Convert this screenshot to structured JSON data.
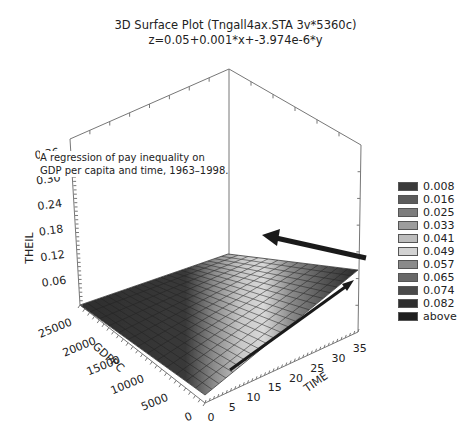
{
  "chart_data": {
    "type": "surface3d",
    "title": "3D Surface Plot (Tngall4ax.STA 3v*5360c)",
    "subtitle": "z=0.05+0.001*x+-3.974e-6*y",
    "equation": {
      "intercept": 0.05,
      "coef_x": 0.001,
      "coef_y": -3.974e-06
    },
    "annotation": [
      "A regression of pay inequality on",
      "GDP per capita and time, 1963–1998."
    ],
    "axes": {
      "z": {
        "label": "THEIL",
        "ticks": [
          "0.06",
          "0.12",
          "0.18",
          "0.24",
          "0.30",
          "0.36"
        ]
      },
      "y": {
        "label": "GDPPC",
        "ticks": [
          "0",
          "5000",
          "10000",
          "15000",
          "20000",
          "25000"
        ]
      },
      "x": {
        "label": "TIME",
        "ticks": [
          "0",
          "5",
          "10",
          "15",
          "20",
          "25",
          "30",
          "35"
        ]
      }
    },
    "legend": [
      {
        "label": "0.008",
        "color": "#3a3a3a"
      },
      {
        "label": "0.016",
        "color": "#5c5c5c"
      },
      {
        "label": "0.025",
        "color": "#7d7d7d"
      },
      {
        "label": "0.033",
        "color": "#9c9c9c"
      },
      {
        "label": "0.041",
        "color": "#bdbdbd"
      },
      {
        "label": "0.049",
        "color": "#d2d2d2"
      },
      {
        "label": "0.057",
        "color": "#8a8a8a"
      },
      {
        "label": "0.065",
        "color": "#686868"
      },
      {
        "label": "0.074",
        "color": "#4a4a4a"
      },
      {
        "label": "0.082",
        "color": "#2e2e2e"
      },
      {
        "label": "above",
        "color": "#1e1e1e"
      }
    ]
  }
}
